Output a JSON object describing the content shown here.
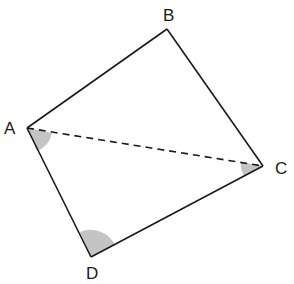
{
  "diagram": {
    "type": "quadrilateral",
    "vertices": [
      {
        "name": "A",
        "x": 27,
        "y": 128,
        "label_x": 4,
        "label_y": 134
      },
      {
        "name": "B",
        "x": 167,
        "y": 29,
        "label_x": 163,
        "label_y": 21
      },
      {
        "name": "C",
        "x": 263,
        "y": 166,
        "label_x": 275,
        "label_y": 174
      },
      {
        "name": "D",
        "x": 91,
        "y": 257,
        "label_x": 86,
        "label_y": 279
      }
    ],
    "edges": [
      [
        "A",
        "B"
      ],
      [
        "B",
        "C"
      ],
      [
        "C",
        "D"
      ],
      [
        "D",
        "A"
      ]
    ],
    "diagonals": [
      {
        "from": "A",
        "to": "C",
        "style": "dashed"
      }
    ],
    "marked_angles": [
      {
        "vertex": "A",
        "between": [
          "D",
          "C"
        ],
        "fill": "#c4c4c4"
      },
      {
        "vertex": "C",
        "between": [
          "A",
          "D"
        ],
        "fill": "#c4c4c4"
      },
      {
        "vertex": "D",
        "between": [
          "A",
          "C"
        ],
        "fill": "#c4c4c4"
      }
    ],
    "colors": {
      "stroke": "#1a1a1a",
      "angle_fill": "#c4c4c4",
      "background": "#ffffff"
    }
  },
  "labels": {
    "A": "A",
    "B": "B",
    "C": "C",
    "D": "D"
  }
}
